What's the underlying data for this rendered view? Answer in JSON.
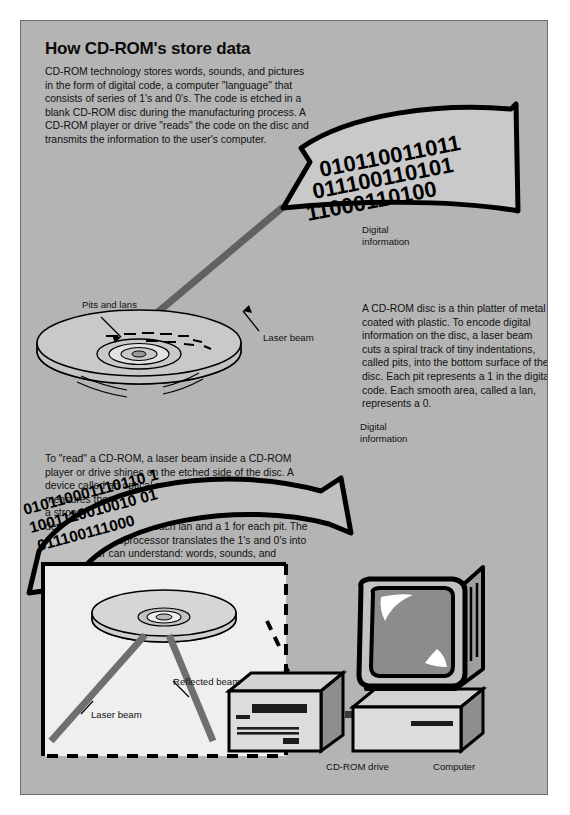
{
  "page": {
    "title": "How CD-ROM's store data",
    "background_color": "#b4b4b4",
    "border_color": "#6e6e6e",
    "page_color": "#ffffff"
  },
  "intro": {
    "text": "CD-ROM technology stores words, sounds, and pictures in the form of digital code, a computer \"language\" that consists of series of 1's and 0's. The code is etched in a blank CD-ROM disc during the manufacturing process. A CD-ROM player or drive \"reads\" the code on the disc and transmits the information to the user's computer."
  },
  "disc_paragraph": {
    "text": "A CD-ROM disc is a thin platter of metal coated with plastic. To encode digital information on the disc, a laser beam cuts a spiral track of tiny indentations, called pits, into the bottom surface of the disc. Each pit represents a 1 in the digital code. Each smooth area, called a lan, represents a 0."
  },
  "read_paragraph": {
    "text": "To \"read\" a CD-ROM, a laser beam inside a CD-ROM player or drive shines on the etched side of the disc. A device called an optical read head inside the drive measures the strength of the reflected light. A lan creates a strong reflection; a pit creates a weaker one. The device registers a 0 for each lan and a 1 for each pit. The computer's microprocessor translates the 1's and 0's into data the user can understand: words, sounds, and pictures."
  },
  "arrow_top": {
    "caption": "Digital\ninformation",
    "binary_lines": [
      "010110011011",
      "011100110101",
      "11000110100"
    ]
  },
  "arrow_bottom": {
    "caption": "Digital\ninformation",
    "binary_lines": [
      "010110001110110 1",
      "1001110010010 01",
      "011100111000"
    ]
  },
  "disc_diagram": {
    "pits_label": "Pits and lans",
    "laser_label": "Laser beam"
  },
  "inset_diagram": {
    "laser_label": "Laser beam",
    "reflected_label": "Reflected beam"
  },
  "hardware": {
    "drive_label": "CD-ROM drive",
    "computer_label": "Computer"
  },
  "colors": {
    "ink": "#111111",
    "beam_gray": "#6a6a6a",
    "panel_gray": "#b4b4b4",
    "light_gray": "#d8d8d8",
    "inset_white": "#efefef",
    "screen_gray": "#8c8c8c"
  }
}
